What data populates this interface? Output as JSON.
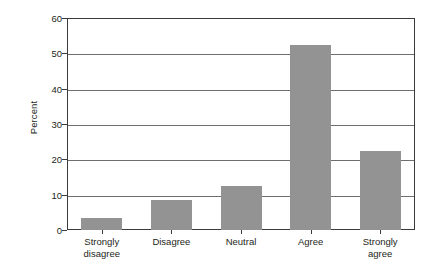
{
  "chart_data": {
    "type": "bar",
    "title": "",
    "subtitle": "",
    "xlabel": "",
    "ylabel": "Percent",
    "categories": [
      "Strongly\ndisagree",
      "Disagree",
      "Neutral",
      "Agree",
      "Strongly\nagree"
    ],
    "values": [
      3.5,
      8.5,
      12.5,
      52.5,
      22.5
    ],
    "ylim": [
      0,
      60
    ],
    "ytick_labels": [
      "0",
      "10",
      "20",
      "30",
      "40",
      "50",
      "60"
    ],
    "ytick_values": [
      0,
      10,
      20,
      30,
      40,
      50,
      60
    ],
    "grid": "horizontal",
    "legend": "none",
    "bar_color": "#939393",
    "axis_color": "#3b3b3b",
    "gridline_color": "#6f6f6f",
    "text_color": "#231f20",
    "background": "#ffffff"
  }
}
